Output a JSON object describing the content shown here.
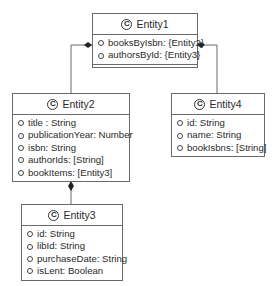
{
  "diagram": {
    "type": "UML class diagram",
    "class_icon": "C",
    "classes": [
      {
        "id": "entity1",
        "name": "Entity1",
        "attributes": [
          "booksByIsbn: {Entity2}",
          "authorsById: {Entity3}"
        ]
      },
      {
        "id": "entity2",
        "name": "Entity2",
        "attributes": [
          "title : String",
          "publicationYear: Number",
          "isbn: String",
          "authorIds: [String]",
          "bookItems: [Entity3]"
        ]
      },
      {
        "id": "entity3",
        "name": "Entity3",
        "attributes": [
          "id: String",
          "libId: String",
          "purchaseDate: String",
          "isLent: Boolean"
        ]
      },
      {
        "id": "entity4",
        "name": "Entity4",
        "attributes": [
          "id: String",
          "name: String",
          "bookIsbns: [String]"
        ]
      }
    ],
    "relationships": [
      {
        "type": "composition",
        "from": "Entity1",
        "to": "Entity2"
      },
      {
        "type": "composition",
        "from": "Entity1",
        "to": "Entity4"
      },
      {
        "type": "composition",
        "from": "Entity2",
        "to": "Entity3"
      }
    ],
    "colors": {
      "line": "#6a6a6a",
      "text": "#2a2a2a",
      "background": "#ffffff"
    }
  }
}
